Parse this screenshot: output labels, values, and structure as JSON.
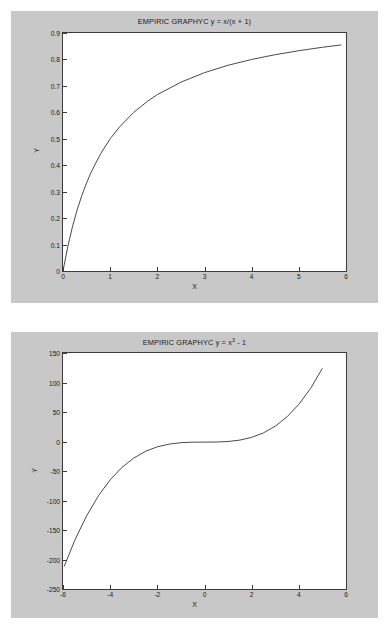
{
  "figures": [
    {
      "title_prefix": "EMPIRIC GRAPHYC y = x/(x + 1)",
      "xlabel": "X",
      "ylabel": "Y",
      "yticks": [
        "0.9",
        "0.8",
        "0.7",
        "0.6",
        "0.5",
        "0.4",
        "0.3",
        "0.2",
        "0.1",
        "0"
      ],
      "xticks": [
        "0",
        "1",
        "2",
        "3",
        "4",
        "5",
        "6"
      ]
    },
    {
      "title_base": "EMPIRIC GRAPHYC y = x",
      "title_exp": "3",
      "title_tail": " - 1",
      "xlabel": "X",
      "ylabel": "Y",
      "yticks": [
        "150",
        "100",
        "50",
        "0",
        "-50",
        "-100",
        "-150",
        "-200",
        "-250"
      ],
      "xticks": [
        "-6",
        "-4",
        "-2",
        "0",
        "2",
        "4",
        "6"
      ]
    }
  ],
  "colors": {
    "figure_background": "#c8c8c8",
    "axes_background": "#ffffff",
    "axis_line": "#3c3c3c",
    "curve": "#4a4a4a",
    "text": "#1a1a1a"
  },
  "chart_data": [
    {
      "type": "line",
      "title": "EMPIRIC GRAPHYC y = x/(x + 1)",
      "xlabel": "X",
      "ylabel": "Y",
      "xlim": [
        0,
        6
      ],
      "ylim": [
        0,
        0.9
      ],
      "xticks": [
        0,
        1,
        2,
        3,
        4,
        5,
        6
      ],
      "yticks": [
        0,
        0.1,
        0.2,
        0.3,
        0.4,
        0.5,
        0.6,
        0.7,
        0.8,
        0.9
      ],
      "grid": false,
      "legend": "none",
      "series": [
        {
          "name": "y = x/(x + 1)",
          "x": [
            0,
            0.1,
            0.2,
            0.3,
            0.4,
            0.5,
            0.6,
            0.8,
            1.0,
            1.2,
            1.5,
            1.8,
            2.0,
            2.5,
            3.0,
            3.5,
            4.0,
            4.5,
            5.0,
            5.5,
            5.9
          ],
          "values": [
            0,
            0.091,
            0.167,
            0.231,
            0.286,
            0.333,
            0.375,
            0.444,
            0.5,
            0.545,
            0.6,
            0.643,
            0.667,
            0.714,
            0.75,
            0.778,
            0.8,
            0.818,
            0.833,
            0.846,
            0.855
          ]
        }
      ]
    },
    {
      "type": "line",
      "title": "EMPIRIC GRAPHYC y = x^3 - 1",
      "xlabel": "X",
      "ylabel": "Y",
      "xlim": [
        -6,
        6
      ],
      "ylim": [
        -250,
        150
      ],
      "xticks": [
        -6,
        -4,
        -2,
        0,
        2,
        4,
        6
      ],
      "yticks": [
        -250,
        -200,
        -150,
        -100,
        -50,
        0,
        50,
        100,
        150
      ],
      "grid": false,
      "legend": "none",
      "series": [
        {
          "name": "y = x^3 - 1",
          "x": [
            -5.95,
            -5.5,
            -5.0,
            -4.5,
            -4.0,
            -3.5,
            -3.0,
            -2.5,
            -2.0,
            -1.5,
            -1.0,
            -0.5,
            0,
            0.5,
            1.0,
            1.5,
            2.0,
            2.5,
            3.0,
            3.5,
            4.0,
            4.5,
            5.0
          ],
          "values": [
            -211.7,
            -167.4,
            -126.0,
            -92.1,
            -65.0,
            -43.9,
            -28.0,
            -16.6,
            -9.0,
            -4.4,
            -2.0,
            -1.125,
            -1.0,
            -0.875,
            0,
            2.375,
            7.0,
            14.6,
            26.0,
            41.9,
            63.0,
            90.1,
            124.0
          ]
        }
      ]
    }
  ]
}
